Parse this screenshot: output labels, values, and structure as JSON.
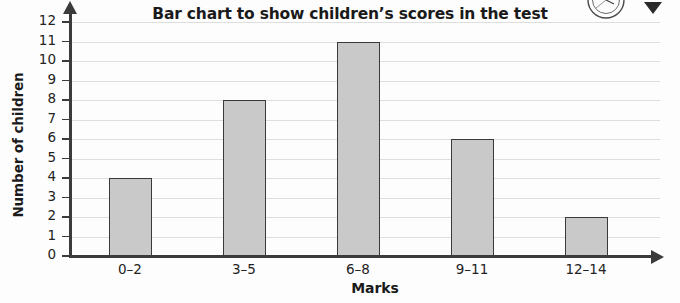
{
  "chart_data": {
    "type": "bar",
    "title": "Bar chart to show children’s scores in the test",
    "xlabel": "Marks",
    "ylabel": "Number of children",
    "categories": [
      "0–2",
      "3–5",
      "6–8",
      "9–11",
      "12–14"
    ],
    "values": [
      4,
      8,
      11,
      6,
      2
    ],
    "ylim": [
      0,
      12
    ],
    "ytick_labels": [
      "0",
      "1",
      "2",
      "3",
      "4",
      "5",
      "6",
      "7",
      "8",
      "9",
      "10",
      "11",
      "12"
    ],
    "ytick_step": 1,
    "grid": true,
    "legend": null,
    "colors": {
      "bar_fill": "#c9c9c9",
      "bar_edge": "#3a3a3a",
      "axis": "#3b3b3b",
      "gridline": "#dedede",
      "text": "#1a1a1a",
      "background": "#fdfdfd"
    }
  },
  "decorations": {
    "corner_graphic": "clock-icon",
    "corner_arrow": "arrow-down-icon"
  }
}
